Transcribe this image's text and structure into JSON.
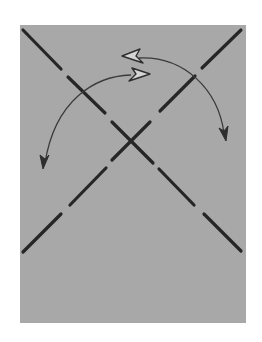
{
  "figure": {
    "strands": [
      {
        "name": "strand-descending",
        "direction": "top-left to bottom-right",
        "segments": 5
      },
      {
        "name": "strand-ascending",
        "direction": "top-right to bottom-left",
        "segments": 5
      }
    ],
    "arrows": [
      {
        "name": "rotation-arrow-left",
        "ends": [
          "hollow-head-right",
          "solid-head-down-left"
        ]
      },
      {
        "name": "rotation-arrow-right",
        "ends": [
          "hollow-head-left",
          "solid-head-down-right"
        ]
      }
    ],
    "colors": {
      "background": "#ffffff",
      "panel": "#a8a8a8",
      "strand": "#262626",
      "arrow": "#3a3a3a"
    }
  }
}
